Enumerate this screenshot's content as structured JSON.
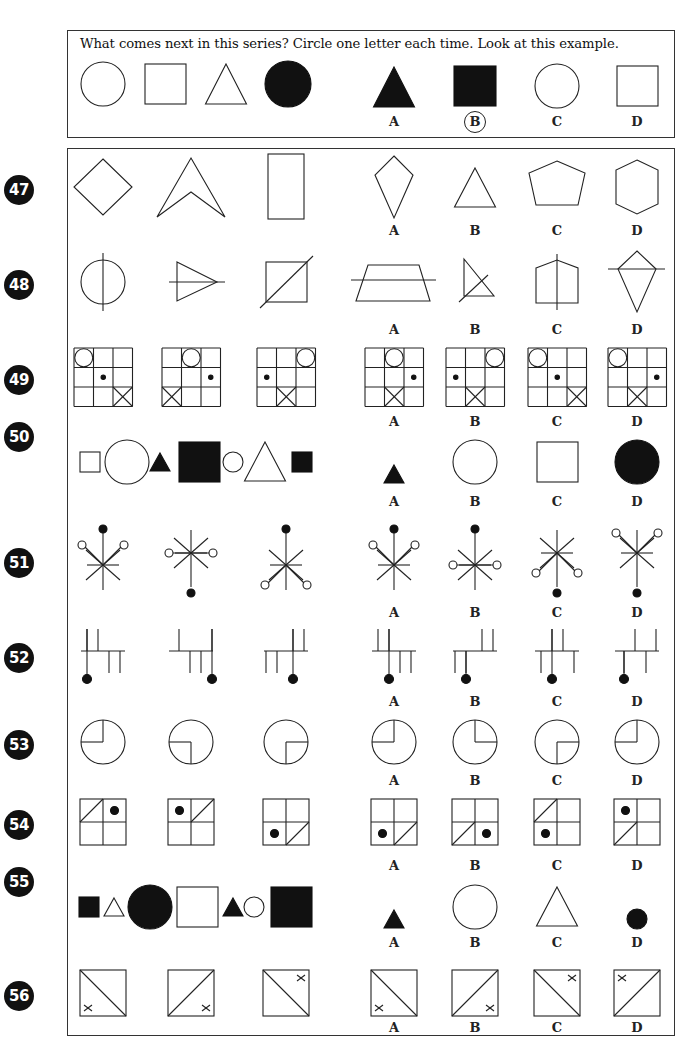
{
  "instruction": "What comes next in this series? Circle one letter each time. Look at this example.",
  "option_letters": [
    "A",
    "B",
    "C",
    "D"
  ],
  "colors": {
    "ink": "#111111",
    "badge": "#111111",
    "badge_text": "#ffffff",
    "border": "#333333"
  },
  "example": {
    "series": [
      "circle-outline",
      "square-outline",
      "triangle-outline",
      "circle-filled"
    ],
    "options": [
      "triangle-filled",
      "square-filled",
      "circle-outline",
      "square-outline"
    ],
    "selected": "B"
  },
  "questions": [
    {
      "number": "47",
      "y": 187,
      "label_y": 223,
      "series": [
        "diamond",
        "chevron-arrowhead",
        "tall-rectangle"
      ],
      "options": [
        "kite",
        "triangle",
        "pentagon",
        "hexagon"
      ]
    },
    {
      "number": "48",
      "y": 282,
      "label_y": 322,
      "series": [
        "circle-with-vertical-line",
        "triangle-with-horizontal-line",
        "square-with-diagonal-line"
      ],
      "options": [
        "trapezoid-with-horizontal-line",
        "right-triangle-with-diagonal-line",
        "house-pentagon-with-vertical-line",
        "kite-with-horizontal-line"
      ]
    },
    {
      "number": "49",
      "y": 377,
      "label_y": 414,
      "series": [
        "grid-circle-r0c0-dot-r1c1-x-r2c2",
        "grid-circle-r0c1-dot-r1c2-x-r2c0",
        "grid-circle-r0c2-dot-r1c0-x-r2c1"
      ],
      "options": [
        "grid-circle-r0c1-dot-r1c2-x-r2c1",
        "grid-circle-r0c2-dot-r1c0-x-r2c1",
        "grid-circle-r0c0-dot-r1c1-x-r2c2",
        "grid-circle-r0c0-dot-r1c2-x-r2c1"
      ]
    },
    {
      "number": "50",
      "y": 462,
      "label_y": 494,
      "series": [
        "small-square-outline",
        "large-circle-outline",
        "small-triangle-filled",
        "large-square-filled",
        "small-circle-outline",
        "large-triangle-outline",
        "small-square-filled"
      ],
      "options": [
        "small-triangle-filled",
        "large-circle-outline",
        "large-square-outline",
        "large-circle-filled"
      ]
    },
    {
      "number": "51",
      "y": 560,
      "label_y": 605,
      "series": [
        "star-filled-top-open-upper",
        "star-filled-bottom-open-middle",
        "star-filled-top-open-lower"
      ],
      "options": [
        "star-filled-top-open-upper",
        "star-filled-top-open-middle",
        "star-filled-bottom-open-lower",
        "star-filled-bottom-open-upper"
      ]
    },
    {
      "number": "52",
      "y": 655,
      "label_y": 694,
      "series": [
        "comb-dot-left",
        "comb-dot-right",
        "comb-dot-middle"
      ],
      "options": [
        "comb-dot-a",
        "comb-dot-b",
        "comb-dot-c",
        "comb-dot-d"
      ]
    },
    {
      "number": "53",
      "y": 742,
      "label_y": 773,
      "series": [
        "circle-quadrant-top-left",
        "circle-quadrant-bottom-left",
        "circle-quadrant-bottom-right"
      ],
      "options": [
        "circle-quadrant-top-left",
        "circle-quadrant-top-right",
        "circle-quadrant-bottom-right",
        "circle-quadrant-top-left"
      ]
    },
    {
      "number": "54",
      "y": 822,
      "label_y": 858,
      "series": [
        "quad-diag-tl-dot-tr",
        "quad-dot-tl-diag-tr",
        "quad-dot-bl-diag-br"
      ],
      "options": [
        "quad-dot-bl-diag-br",
        "quad-diag-bl-dot-br",
        "quad-diag-tl-dot-bl",
        "quad-dot-tl-diag-bl"
      ]
    },
    {
      "number": "55",
      "y": 907,
      "label_y": 935,
      "series": [
        "small-square-filled",
        "small-triangle-outline",
        "large-circle-filled",
        "large-square-outline",
        "small-triangle-filled",
        "small-circle-outline",
        "large-square-filled"
      ],
      "options": [
        "small-triangle-filled",
        "large-circle-outline",
        "large-triangle-outline",
        "small-circle-filled"
      ]
    },
    {
      "number": "56",
      "y": 993,
      "label_y": 1020,
      "series": [
        "square-diag-down-x-bottom-left",
        "square-diag-up-x-bottom-right",
        "square-diag-down-x-top-right"
      ],
      "options": [
        "square-diag-down-x-bottom-left",
        "square-diag-up-x-bottom-right",
        "square-diag-down-x-top-right",
        "square-diag-up-x-top-left"
      ]
    }
  ]
}
